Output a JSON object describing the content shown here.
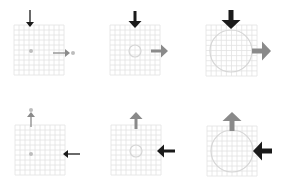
{
  "colors": {
    "background": "#ffffff",
    "grid": "#e2e2e2",
    "circle": "#d6d6d6",
    "dot": "#bdbdbd",
    "arrow_black": "#1a1a1a",
    "arrow_gray": "#8a8a8a"
  },
  "panels": [
    {
      "id": "top-left",
      "grid": {
        "x": 14,
        "y": 25,
        "size": 50
      },
      "shape": "dot",
      "center": [
        31,
        51
      ],
      "radius": 2,
      "arrows": [
        {
          "dir": "down",
          "color": "black",
          "weight": "thin",
          "x": 30,
          "from": 10,
          "to": 27
        },
        {
          "dir": "right",
          "color": "gray",
          "weight": "thin",
          "y": 53,
          "from": 53,
          "to": 70
        },
        {
          "dot": [
            73,
            53
          ]
        }
      ]
    },
    {
      "id": "top-middle",
      "grid": {
        "x": 110,
        "y": 25,
        "size": 50
      },
      "shape": "circle",
      "center": [
        135,
        51
      ],
      "radius": 6,
      "arrows": [
        {
          "dir": "down",
          "color": "black",
          "weight": "medium",
          "x": 135,
          "from": 11,
          "to": 28
        },
        {
          "dir": "right",
          "color": "gray",
          "weight": "medium",
          "y": 51,
          "from": 151,
          "to": 168
        }
      ]
    },
    {
      "id": "top-right",
      "grid": {
        "x": 206,
        "y": 25,
        "size": 51
      },
      "shape": "circle",
      "center": [
        231,
        51
      ],
      "radius": 21,
      "arrows": [
        {
          "dir": "down",
          "color": "black",
          "weight": "thick",
          "x": 231,
          "from": 10,
          "to": 29
        },
        {
          "dir": "right",
          "color": "gray",
          "weight": "thick",
          "y": 51,
          "from": 252,
          "to": 271
        }
      ]
    },
    {
      "id": "bottom-left",
      "grid": {
        "x": 15,
        "y": 125,
        "size": 50
      },
      "shape": "dot",
      "center": [
        31,
        154
      ],
      "radius": 2,
      "arrows": [
        {
          "dir": "up",
          "color": "gray",
          "weight": "thin",
          "x": 31,
          "from": 127,
          "to": 112
        },
        {
          "dot": [
            31,
            110
          ]
        },
        {
          "dir": "left",
          "color": "black",
          "weight": "thin",
          "y": 154,
          "from": 80,
          "to": 63
        }
      ]
    },
    {
      "id": "bottom-middle",
      "grid": {
        "x": 111,
        "y": 125,
        "size": 50
      },
      "shape": "circle",
      "center": [
        136,
        151
      ],
      "radius": 6,
      "arrows": [
        {
          "dir": "up",
          "color": "gray",
          "weight": "medium",
          "x": 136,
          "from": 129,
          "to": 112
        },
        {
          "dir": "left",
          "color": "black",
          "weight": "medium",
          "y": 151,
          "from": 175,
          "to": 157
        }
      ]
    },
    {
      "id": "bottom-right",
      "grid": {
        "x": 207,
        "y": 126,
        "size": 50
      },
      "shape": "circle",
      "center": [
        232,
        151
      ],
      "radius": 21,
      "arrows": [
        {
          "dir": "up",
          "color": "gray",
          "weight": "thick",
          "x": 232,
          "from": 131,
          "to": 112
        },
        {
          "dir": "left",
          "color": "black",
          "weight": "thick",
          "y": 151,
          "from": 272,
          "to": 253
        }
      ]
    }
  ]
}
